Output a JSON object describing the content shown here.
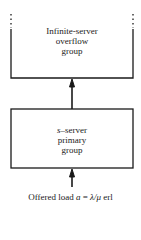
{
  "diagram": {
    "overflow_group": {
      "lines": [
        "Infinite-server",
        "overflow",
        "group"
      ]
    },
    "primary_group": {
      "lines_prefix_italic": "s",
      "line1_rest": "–server",
      "lines": [
        "primary",
        "group"
      ]
    },
    "offered_load": {
      "prefix": "Offered load ",
      "var_a": "a",
      "equals": " = ",
      "formula": "λ/μ",
      "unit": " erl"
    },
    "colors": {
      "stroke": "#1a1a1a",
      "background": "#ffffff"
    }
  }
}
